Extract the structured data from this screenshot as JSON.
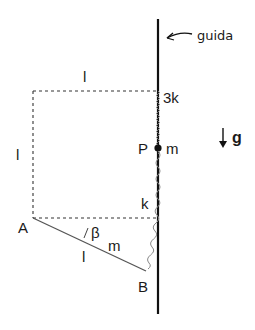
{
  "diagram": {
    "guide_label": "guida",
    "top_length_label": "l",
    "left_length_label": "l",
    "rod_length_label": "l",
    "upper_spring_label": "3k",
    "lower_spring_label": "k",
    "point_P_label": "P",
    "point_P_mass_label": "m",
    "point_A_label": "A",
    "point_B_label": "B",
    "rod_mass_label": "m",
    "angle_label": "β",
    "gravity_label": "g",
    "colors": {
      "guide": "#111111",
      "dashed": "#333333",
      "rod": "#555555",
      "spring": "#777777"
    }
  }
}
